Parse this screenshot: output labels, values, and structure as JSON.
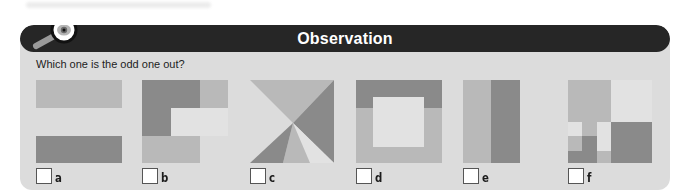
{
  "header": {
    "title": "Observation",
    "icon": "magnifier-eye-icon"
  },
  "question": "Which one is the odd one out?",
  "colors": {
    "header_bg": "#262626",
    "panel_bg": "#dcdcdc",
    "shape_dark": "#8a8a8a",
    "shape_mid": "#b9b9b9",
    "shape_pale": "#e2e2e2"
  },
  "options": [
    {
      "label": "a",
      "checked": false
    },
    {
      "label": "b",
      "checked": false
    },
    {
      "label": "c",
      "checked": false
    },
    {
      "label": "d",
      "checked": false
    },
    {
      "label": "e",
      "checked": false
    },
    {
      "label": "f",
      "checked": false
    }
  ]
}
